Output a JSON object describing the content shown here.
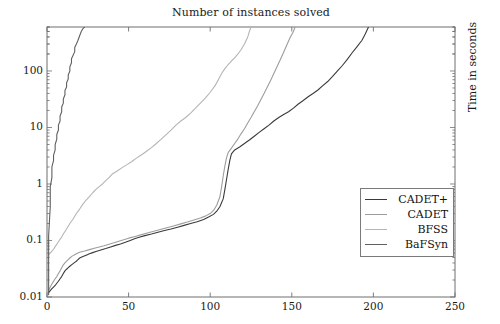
{
  "chart_data": {
    "type": "line",
    "title": "Number of instances solved",
    "xlabel": "",
    "ylabel": "Time in seconds",
    "ylabel_position": "right",
    "xscale": "linear",
    "yscale": "log",
    "xlim": [
      0,
      250
    ],
    "ylim": [
      0.01,
      600
    ],
    "grid": false,
    "legend_position": "lower right",
    "xticks": [
      0,
      50,
      100,
      150,
      200,
      250
    ],
    "xtick_labels": [
      "0",
      "50",
      "100",
      "150",
      "200",
      "250"
    ],
    "yticks": [
      0.01,
      0.1,
      1,
      10,
      100
    ],
    "ytick_labels": [
      "0.01",
      "0.1",
      "1",
      "10",
      "100"
    ],
    "series": [
      {
        "name": "CADET+",
        "color": "#3a3a3a",
        "points": [
          [
            1,
            0.012
          ],
          [
            2,
            0.013
          ],
          [
            3,
            0.014
          ],
          [
            4,
            0.015
          ],
          [
            5,
            0.016
          ],
          [
            6,
            0.0175
          ],
          [
            7,
            0.019
          ],
          [
            8,
            0.021
          ],
          [
            9,
            0.023
          ],
          [
            10,
            0.026
          ],
          [
            11,
            0.029
          ],
          [
            12,
            0.031
          ],
          [
            13,
            0.033
          ],
          [
            14,
            0.035
          ],
          [
            15,
            0.037
          ],
          [
            16,
            0.039
          ],
          [
            17,
            0.041
          ],
          [
            18,
            0.043
          ],
          [
            19,
            0.046
          ],
          [
            20,
            0.049
          ],
          [
            22,
            0.052
          ],
          [
            24,
            0.055
          ],
          [
            26,
            0.058
          ],
          [
            28,
            0.061
          ],
          [
            30,
            0.064
          ],
          [
            33,
            0.068
          ],
          [
            36,
            0.072
          ],
          [
            39,
            0.077
          ],
          [
            42,
            0.082
          ],
          [
            45,
            0.087
          ],
          [
            48,
            0.093
          ],
          [
            51,
            0.1
          ],
          [
            54,
            0.108
          ],
          [
            57,
            0.115
          ],
          [
            60,
            0.122
          ],
          [
            64,
            0.13
          ],
          [
            68,
            0.14
          ],
          [
            72,
            0.15
          ],
          [
            76,
            0.16
          ],
          [
            80,
            0.172
          ],
          [
            84,
            0.185
          ],
          [
            88,
            0.2
          ],
          [
            92,
            0.215
          ],
          [
            96,
            0.235
          ],
          [
            99,
            0.26
          ],
          [
            102,
            0.29
          ],
          [
            104,
            0.33
          ],
          [
            106,
            0.4
          ],
          [
            108,
            0.55
          ],
          [
            109,
            0.8
          ],
          [
            110,
            1.2
          ],
          [
            111,
            1.8
          ],
          [
            112,
            2.6
          ],
          [
            113,
            3.4
          ],
          [
            115,
            4.0
          ],
          [
            118,
            4.5
          ],
          [
            121,
            5.2
          ],
          [
            124,
            6.0
          ],
          [
            127,
            7.0
          ],
          [
            130,
            8.2
          ],
          [
            133,
            9.5
          ],
          [
            136,
            11
          ],
          [
            139,
            13
          ],
          [
            142,
            15
          ],
          [
            145,
            17
          ],
          [
            148,
            19
          ],
          [
            151,
            22
          ],
          [
            154,
            26
          ],
          [
            157,
            30
          ],
          [
            160,
            35
          ],
          [
            163,
            40
          ],
          [
            166,
            46
          ],
          [
            169,
            55
          ],
          [
            172,
            65
          ],
          [
            175,
            80
          ],
          [
            178,
            100
          ],
          [
            181,
            125
          ],
          [
            184,
            160
          ],
          [
            187,
            210
          ],
          [
            190,
            270
          ],
          [
            193,
            350
          ],
          [
            195,
            450
          ],
          [
            197,
            600
          ]
        ]
      },
      {
        "name": "CADET",
        "color": "#9d9d9d",
        "points": [
          [
            1,
            0.013
          ],
          [
            2,
            0.015
          ],
          [
            3,
            0.017
          ],
          [
            4,
            0.019
          ],
          [
            5,
            0.021
          ],
          [
            6,
            0.023
          ],
          [
            7,
            0.026
          ],
          [
            8,
            0.029
          ],
          [
            9,
            0.033
          ],
          [
            10,
            0.037
          ],
          [
            11,
            0.04
          ],
          [
            12,
            0.043
          ],
          [
            13,
            0.046
          ],
          [
            14,
            0.049
          ],
          [
            15,
            0.052
          ],
          [
            16,
            0.054
          ],
          [
            17,
            0.056
          ],
          [
            18,
            0.058
          ],
          [
            19,
            0.06
          ],
          [
            20,
            0.062
          ],
          [
            23,
            0.065
          ],
          [
            26,
            0.069
          ],
          [
            29,
            0.073
          ],
          [
            32,
            0.077
          ],
          [
            35,
            0.081
          ],
          [
            38,
            0.086
          ],
          [
            41,
            0.091
          ],
          [
            44,
            0.097
          ],
          [
            47,
            0.103
          ],
          [
            50,
            0.11
          ],
          [
            54,
            0.118
          ],
          [
            58,
            0.127
          ],
          [
            62,
            0.137
          ],
          [
            66,
            0.147
          ],
          [
            70,
            0.158
          ],
          [
            74,
            0.17
          ],
          [
            78,
            0.183
          ],
          [
            82,
            0.197
          ],
          [
            86,
            0.212
          ],
          [
            90,
            0.23
          ],
          [
            94,
            0.25
          ],
          [
            97,
            0.27
          ],
          [
            100,
            0.3
          ],
          [
            102,
            0.34
          ],
          [
            104,
            0.42
          ],
          [
            106,
            0.6
          ],
          [
            107,
            0.9
          ],
          [
            108,
            1.4
          ],
          [
            109,
            2.1
          ],
          [
            110,
            2.9
          ],
          [
            111,
            3.6
          ],
          [
            113,
            4.3
          ],
          [
            115,
            5.2
          ],
          [
            117,
            6.3
          ],
          [
            119,
            7.8
          ],
          [
            121,
            9.5
          ],
          [
            123,
            12
          ],
          [
            125,
            15
          ],
          [
            127,
            19
          ],
          [
            129,
            24
          ],
          [
            131,
            31
          ],
          [
            133,
            40
          ],
          [
            135,
            52
          ],
          [
            137,
            68
          ],
          [
            139,
            90
          ],
          [
            141,
            120
          ],
          [
            143,
            160
          ],
          [
            145,
            215
          ],
          [
            147,
            290
          ],
          [
            149,
            390
          ],
          [
            151,
            500
          ],
          [
            152,
            600
          ]
        ]
      },
      {
        "name": "BFSS",
        "color": "#b5b5b5",
        "points": [
          [
            1,
            0.055
          ],
          [
            2,
            0.06
          ],
          [
            3,
            0.065
          ],
          [
            4,
            0.07
          ],
          [
            5,
            0.078
          ],
          [
            6,
            0.086
          ],
          [
            7,
            0.095
          ],
          [
            8,
            0.105
          ],
          [
            9,
            0.115
          ],
          [
            10,
            0.13
          ],
          [
            12,
            0.16
          ],
          [
            14,
            0.2
          ],
          [
            16,
            0.24
          ],
          [
            18,
            0.3
          ],
          [
            20,
            0.36
          ],
          [
            22,
            0.44
          ],
          [
            24,
            0.52
          ],
          [
            26,
            0.6
          ],
          [
            28,
            0.7
          ],
          [
            30,
            0.8
          ],
          [
            32,
            0.9
          ],
          [
            34,
            1.0
          ],
          [
            36,
            1.15
          ],
          [
            38,
            1.3
          ],
          [
            40,
            1.5
          ],
          [
            43,
            1.7
          ],
          [
            46,
            1.95
          ],
          [
            49,
            2.2
          ],
          [
            52,
            2.5
          ],
          [
            55,
            2.9
          ],
          [
            58,
            3.3
          ],
          [
            61,
            3.8
          ],
          [
            64,
            4.4
          ],
          [
            67,
            5.2
          ],
          [
            70,
            6.2
          ],
          [
            73,
            7.5
          ],
          [
            76,
            9.0
          ],
          [
            79,
            11
          ],
          [
            82,
            13
          ],
          [
            85,
            15
          ],
          [
            88,
            18
          ],
          [
            91,
            22
          ],
          [
            94,
            27
          ],
          [
            97,
            33
          ],
          [
            100,
            42
          ],
          [
            103,
            55
          ],
          [
            105,
            70
          ],
          [
            107,
            90
          ],
          [
            109,
            110
          ],
          [
            111,
            130
          ],
          [
            113,
            150
          ],
          [
            115,
            170
          ],
          [
            117,
            200
          ],
          [
            119,
            240
          ],
          [
            121,
            300
          ],
          [
            123,
            400
          ],
          [
            124,
            500
          ],
          [
            125,
            600
          ]
        ]
      },
      {
        "name": "BaFSyn",
        "color": "#606060",
        "points": [
          [
            1,
            0.011
          ],
          [
            1,
            0.05
          ],
          [
            1,
            0.12
          ],
          [
            2,
            0.4
          ],
          [
            2,
            0.9
          ],
          [
            3,
            1.3
          ],
          [
            3,
            2.0
          ],
          [
            4,
            2.6
          ],
          [
            4,
            3.2
          ],
          [
            5,
            4.0
          ],
          [
            5,
            5.0
          ],
          [
            6,
            6.2
          ],
          [
            6,
            7.5
          ],
          [
            7,
            9.0
          ],
          [
            7,
            11
          ],
          [
            8,
            13
          ],
          [
            8,
            16
          ],
          [
            9,
            19
          ],
          [
            9,
            23
          ],
          [
            10,
            27
          ],
          [
            10,
            32
          ],
          [
            11,
            38
          ],
          [
            11,
            45
          ],
          [
            12,
            52
          ],
          [
            12,
            62
          ],
          [
            13,
            72
          ],
          [
            13,
            85
          ],
          [
            14,
            100
          ],
          [
            14,
            118
          ],
          [
            15,
            140
          ],
          [
            15,
            165
          ],
          [
            16,
            190
          ],
          [
            17,
            220
          ],
          [
            17,
            260
          ],
          [
            18,
            300
          ],
          [
            19,
            350
          ],
          [
            20,
            420
          ],
          [
            21,
            500
          ],
          [
            22,
            560
          ],
          [
            23,
            600
          ]
        ]
      }
    ]
  },
  "legend": {
    "entries": [
      {
        "label": "CADET+"
      },
      {
        "label": "CADET"
      },
      {
        "label": "BFSS"
      },
      {
        "label": "BaFSyn"
      }
    ]
  },
  "axes": {
    "title": "Number of instances solved",
    "right_label": "Time in seconds"
  }
}
